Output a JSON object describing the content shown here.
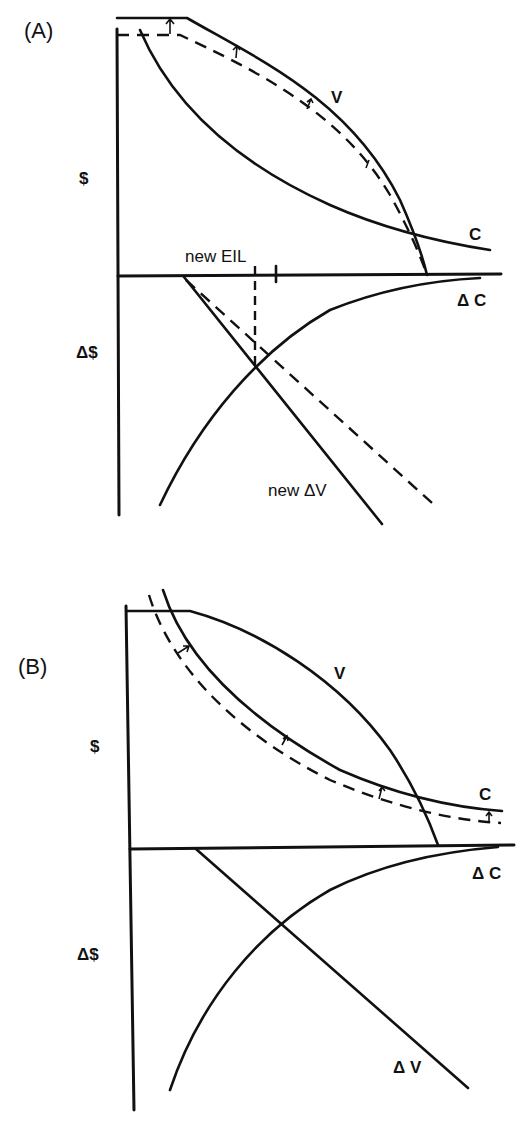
{
  "panels": [
    {
      "id": "A",
      "label": "(A)",
      "upper_axis_label": "$",
      "lower_axis_label": "Δ$",
      "curves": {
        "V": "V",
        "C": "C",
        "dC": "Δ C",
        "new_dV": "new  ΔV"
      },
      "annotation": "new EIL"
    },
    {
      "id": "B",
      "label": "(B)",
      "upper_axis_label": "$",
      "lower_axis_label": "Δ$",
      "curves": {
        "V": "V",
        "C": "C",
        "dC": "Δ C",
        "dV": "Δ V"
      }
    }
  ],
  "colors": {
    "ink": "#111111",
    "background": "#ffffff"
  }
}
